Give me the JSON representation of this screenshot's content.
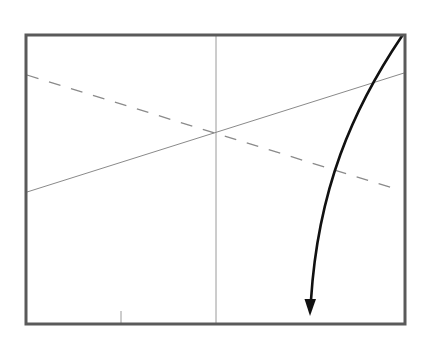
{
  "canvas": {
    "width": 426,
    "height": 347,
    "background": "#ffffff"
  },
  "frame": {
    "x": 26,
    "y": 35,
    "width": 379,
    "height": 289,
    "stroke": "#5a5a5a",
    "stroke_width": 3
  },
  "vertical_axis": {
    "x": 216,
    "y1": 36,
    "y2": 323,
    "stroke": "#9a9a9a",
    "stroke_width": 1
  },
  "tick_mark": {
    "x": 121,
    "y1": 311,
    "y2": 323,
    "stroke": "#9a9a9a",
    "stroke_width": 1
  },
  "solid_line": {
    "x1": 27,
    "y1": 192,
    "x2": 404,
    "y2": 73,
    "stroke": "#8a8a8a",
    "stroke_width": 1
  },
  "dashed_line": {
    "x1": 27,
    "y1": 75,
    "x2": 396,
    "y2": 189,
    "stroke": "#8a8a8a",
    "stroke_width": 1.3,
    "dash": "12,11"
  },
  "curved_arrow": {
    "path": "M 402 36 C 352 110, 318 190, 311 300",
    "stroke": "#111111",
    "stroke_width": 2.6,
    "head": {
      "tip_x": 310,
      "tip_y": 316,
      "half_width": 5.5,
      "length": 17
    }
  },
  "center_point": {
    "x": 216,
    "y": 132
  }
}
